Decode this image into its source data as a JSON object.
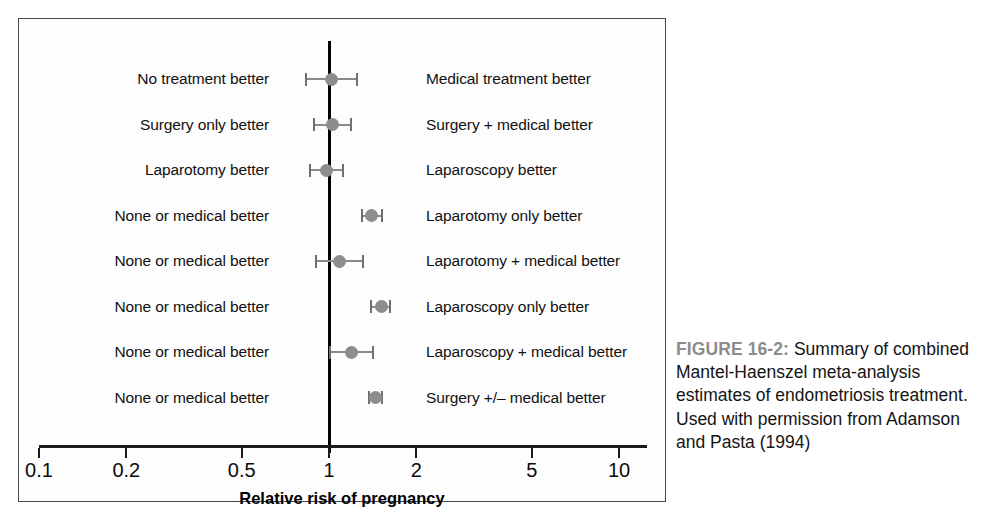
{
  "figure": {
    "caption_label": "FIGURE 16-2:",
    "caption_text": " Summary of combined Mantel-Haenszel meta-analysis estimates of endometriosis treatment. Used with permission from Adamson and Pasta (1994)"
  },
  "chart_data": {
    "type": "forest",
    "title": "",
    "xlabel": "Relative risk of pregnancy",
    "ylabel": "",
    "xscale": "log",
    "xlim": [
      0.085,
      12.5
    ],
    "xticks": [
      0.1,
      0.2,
      0.5,
      1,
      2,
      5,
      10
    ],
    "xticklabels": [
      "0.1",
      "0.2",
      "0.5",
      "1",
      "2",
      "5",
      "10"
    ],
    "reference_line": 1,
    "grid": false,
    "legend": "none",
    "marker_color": "#8d8d8d",
    "rows": [
      {
        "left_label": "No treatment better",
        "right_label": "Medical treatment better",
        "estimate": 1.02,
        "ci_low": 0.83,
        "ci_high": 1.25
      },
      {
        "left_label": "Surgery only better",
        "right_label": "Surgery + medical better",
        "estimate": 1.03,
        "ci_low": 0.89,
        "ci_high": 1.19
      },
      {
        "left_label": "Laparotomy better",
        "right_label": "Laparoscopy better",
        "estimate": 0.98,
        "ci_low": 0.86,
        "ci_high": 1.12
      },
      {
        "left_label": "None or medical better",
        "right_label": "Laparotomy only better",
        "estimate": 1.4,
        "ci_low": 1.3,
        "ci_high": 1.52
      },
      {
        "left_label": "None or medical better",
        "right_label": "Laparotomy + medical better",
        "estimate": 1.09,
        "ci_low": 0.9,
        "ci_high": 1.31
      },
      {
        "left_label": "None or medical better",
        "right_label": "Laparoscopy only better",
        "estimate": 1.52,
        "ci_low": 1.4,
        "ci_high": 1.62
      },
      {
        "left_label": "None or medical better",
        "right_label": "Laparoscopy + medical better",
        "estimate": 1.2,
        "ci_low": 1.01,
        "ci_high": 1.42
      },
      {
        "left_label": "None or medical better",
        "right_label": "Surgery +/– medical better",
        "estimate": 1.45,
        "ci_low": 1.37,
        "ci_high": 1.52
      }
    ]
  }
}
